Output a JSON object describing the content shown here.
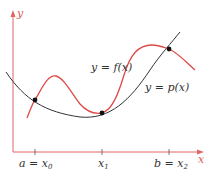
{
  "axes": {
    "x_label": "x",
    "y_label": "y",
    "axis_color": "#e06666"
  },
  "curves": {
    "f": {
      "label": "y = f(x)",
      "color": "#e04848"
    },
    "p": {
      "label": "y = p(x)",
      "color": "#333333"
    }
  },
  "ticks": [
    {
      "pre": "a = x",
      "sub": "0"
    },
    {
      "pre": "x",
      "sub": "1"
    },
    {
      "pre": "b = x",
      "sub": "2"
    }
  ],
  "interpolation_points": 3
}
